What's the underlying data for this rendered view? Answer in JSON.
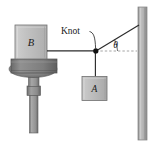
{
  "figure": {
    "name": "knot-tension-diagram",
    "background_color": "#ffffff",
    "labels": {
      "block_b": "B",
      "block_a": "A",
      "knot": "Knot",
      "angle": "θ"
    },
    "colors": {
      "block_fill": "#b9b9b9",
      "block_fill_light": "#c9c9c9",
      "block_stroke": "#6e6e6e",
      "pedestal_slab": "#8a8a8a",
      "pedestal_dark": "#6f6f6f",
      "post_fill": "#9a9a9a",
      "wall_fill": "#a8a8a8",
      "wall_stroke": "#7a7a7a",
      "rope": "#2b2b2b",
      "knot_dot": "#111111",
      "dashed_reference": "#8f8f8f",
      "text": "#1a1a1a"
    },
    "geometry": {
      "knot_point": [
        96,
        51
      ],
      "wall_anchor": [
        139,
        25
      ],
      "block_b_rect": [
        15,
        25,
        32,
        33
      ],
      "block_a_rect": [
        82,
        76,
        25,
        24
      ],
      "wall_rect": [
        138,
        7,
        9,
        133
      ],
      "angle_degrees": 31
    }
  }
}
